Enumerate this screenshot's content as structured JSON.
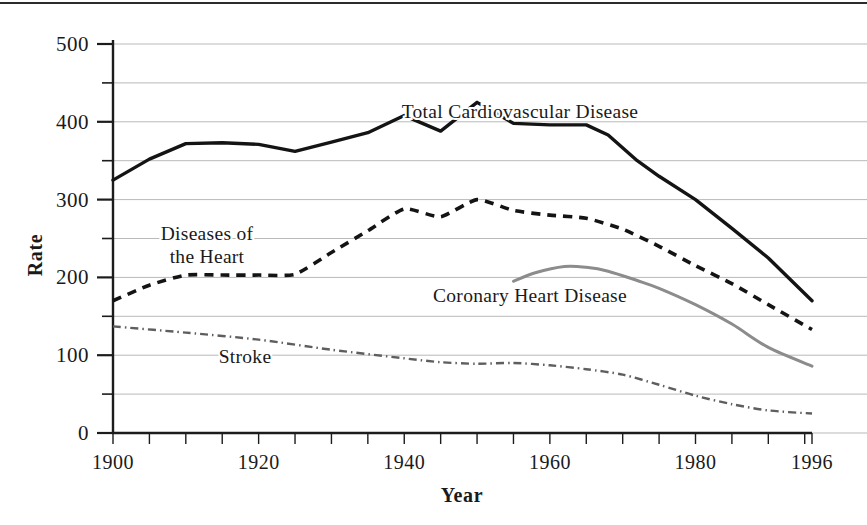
{
  "chart_data": {
    "type": "line",
    "title": "",
    "xlabel": "Year",
    "ylabel": "Rate",
    "xlim": [
      1900,
      1996
    ],
    "ylim": [
      0,
      500
    ],
    "grid": true,
    "legend_position": "inline-annotations",
    "y_ticks_major": [
      0,
      100,
      200,
      300,
      400,
      500
    ],
    "y_ticks_minor": [
      50,
      150,
      250,
      350,
      450
    ],
    "x_tick_labels": [
      "1900",
      "1920",
      "1940",
      "1960",
      "1980",
      "1996"
    ],
    "x_tick_label_values": [
      1900,
      1920,
      1940,
      1960,
      1980,
      1996
    ],
    "x_tick_step_years": 5,
    "series": [
      {
        "name": "Total Cardiovascular Disease",
        "style": "solid",
        "color": "#141414",
        "x": [
          1900,
          1905,
          1910,
          1915,
          1920,
          1925,
          1930,
          1935,
          1940,
          1945,
          1950,
          1955,
          1960,
          1965,
          1968,
          1972,
          1975,
          1980,
          1985,
          1990,
          1996
        ],
        "values": [
          325,
          352,
          372,
          373,
          371,
          362,
          374,
          386,
          408,
          388,
          425,
          398,
          396,
          396,
          383,
          350,
          330,
          300,
          263,
          225,
          170
        ]
      },
      {
        "name": "Diseases of the Heart",
        "style": "dashed",
        "color": "#141414",
        "x": [
          1900,
          1905,
          1910,
          1915,
          1920,
          1925,
          1930,
          1935,
          1940,
          1945,
          1950,
          1955,
          1960,
          1965,
          1970,
          1975,
          1980,
          1985,
          1990,
          1996
        ],
        "values": [
          170,
          190,
          203,
          203,
          203,
          204,
          232,
          260,
          288,
          278,
          300,
          286,
          280,
          276,
          262,
          240,
          215,
          192,
          165,
          133
        ]
      },
      {
        "name": "Coronary Heart Disease",
        "style": "solid-gray",
        "color": "#8c8c8c",
        "x": [
          1955,
          1958,
          1962,
          1965,
          1968,
          1972,
          1975,
          1980,
          1985,
          1990,
          1996
        ],
        "values": [
          195,
          206,
          214,
          213,
          208,
          196,
          186,
          165,
          140,
          110,
          86
        ]
      },
      {
        "name": "Stroke",
        "style": "dash-dot",
        "color": "#5e5e5e",
        "x": [
          1900,
          1910,
          1920,
          1930,
          1940,
          1945,
          1950,
          1955,
          1960,
          1965,
          1970,
          1975,
          1980,
          1985,
          1990,
          1996
        ],
        "values": [
          137,
          129,
          120,
          107,
          96,
          91,
          89,
          90,
          87,
          82,
          75,
          62,
          48,
          37,
          29,
          25
        ]
      }
    ],
    "annotations": [
      {
        "name": "total-cardiovascular-disease",
        "text": "Total Cardiovascular Disease",
        "x": 520,
        "y": 118
      },
      {
        "name": "diseases-of-the-heart-line1",
        "text": "Diseases of",
        "x": 207,
        "y": 240
      },
      {
        "name": "diseases-of-the-heart-line2",
        "text": "the Heart",
        "x": 207,
        "y": 263
      },
      {
        "name": "coronary-heart-disease",
        "text": "Coronary Heart Disease",
        "x": 530,
        "y": 302
      },
      {
        "name": "stroke",
        "text": "Stroke",
        "x": 245,
        "y": 363
      }
    ]
  },
  "axes": {
    "y_label": "Rate",
    "x_label": "Year",
    "y_tick_labels": [
      "500",
      "400",
      "300",
      "200",
      "100",
      "0"
    ],
    "x_tick_labels": [
      "1900",
      "1920",
      "1940",
      "1960",
      "1980",
      "1996"
    ]
  },
  "labels": {
    "cvd": "Total Cardiovascular Disease",
    "dhd_line1": "Diseases of",
    "dhd_line2": "the Heart",
    "chd": "Coronary Heart Disease",
    "stroke": "Stroke"
  },
  "colors": {
    "background": "#ffffff",
    "ink": "#141414",
    "grid": "#b9b9b9",
    "gray_series": "#8c8c8c",
    "stroke_series": "#5e5e5e"
  }
}
